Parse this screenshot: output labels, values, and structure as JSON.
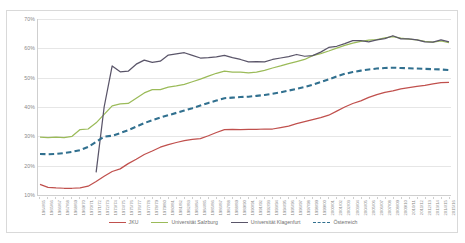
{
  "chart_data": {
    "type": "line",
    "title": "",
    "xlabel": "",
    "ylabel": "",
    "ylim": [
      10,
      70
    ],
    "ytick_labels": [
      "10%",
      "20%",
      "30%",
      "40%",
      "50%",
      "60%",
      "70%"
    ],
    "ytick_values": [
      10,
      20,
      30,
      40,
      50,
      60,
      70
    ],
    "grid": true,
    "legend_position": "bottom",
    "categories": [
      "1964/65",
      "1965/66",
      "1966/67",
      "1967/68",
      "1968/69",
      "1969/70",
      "1970/71",
      "1971/72",
      "1972/73",
      "1973/74",
      "1974/75",
      "1975/76",
      "1976/77",
      "1977/78",
      "1978/79",
      "1979/80",
      "1980/81",
      "1981/82",
      "1982/83",
      "1983/84",
      "1984/85",
      "1985/86",
      "1986/87",
      "1987/88",
      "1988/89",
      "1989/90",
      "1990/91",
      "1991/92",
      "1992/93",
      "1993/94",
      "1994/95",
      "1995/96",
      "1996/97",
      "1997/98",
      "1998/99",
      "1999/00",
      "2000/01",
      "2001/02",
      "2002/03",
      "2003/04",
      "2004/05",
      "2005/06",
      "2006/07",
      "2007/08",
      "2008/09",
      "2009/10",
      "2010/11",
      "2011/12",
      "2012/13",
      "2013/14",
      "2014/15",
      "2015/16"
    ],
    "series": [
      {
        "name": "JKU",
        "color": "#C0504D",
        "style": "solid",
        "values": [
          13.6,
          12.6,
          12.4,
          12.3,
          12.3,
          12.4,
          13.0,
          14.6,
          16.4,
          18.0,
          18.9,
          20.7,
          22.2,
          23.8,
          25.0,
          26.3,
          27.2,
          27.9,
          28.5,
          29.0,
          29.2,
          30.2,
          31.3,
          32.3,
          32.4,
          32.3,
          32.4,
          32.4,
          32.5,
          32.5,
          33.0,
          33.5,
          34.3,
          35.0,
          35.7,
          36.4,
          37.2,
          38.6,
          40.0,
          41.2,
          42.1,
          43.3,
          44.2,
          45.0,
          45.5,
          46.2,
          46.6,
          47.0,
          47.4,
          47.9,
          48.3,
          48.4
        ]
      },
      {
        "name": "Universität Salzburg",
        "color": "#9BBB59",
        "style": "solid",
        "values": [
          29.7,
          29.6,
          29.7,
          29.6,
          30.0,
          32.3,
          32.5,
          34.6,
          37.5,
          40.4,
          41.1,
          41.2,
          43.0,
          44.8,
          45.9,
          45.9,
          46.8,
          47.2,
          47.7,
          48.6,
          49.5,
          50.5,
          51.5,
          52.2,
          51.9,
          51.9,
          51.6,
          51.9,
          52.5,
          53.3,
          54.0,
          54.8,
          55.5,
          56.2,
          57.5,
          58.2,
          59.1,
          60.1,
          61.0,
          61.8,
          62.4,
          62.8,
          63.0,
          63.6,
          64.0,
          63.5,
          63.1,
          62.9,
          62.4,
          62.1,
          62.5,
          61.9
        ]
      },
      {
        "name": "Universität Klagenfurt",
        "color": "#5A5569",
        "style": "solid",
        "values": [
          null,
          null,
          null,
          null,
          null,
          null,
          null,
          17.7,
          40.0,
          54.0,
          52.0,
          52.2,
          54.6,
          56.0,
          55.2,
          55.6,
          57.7,
          58.1,
          58.5,
          57.6,
          56.7,
          56.8,
          57.1,
          57.6,
          56.8,
          56.2,
          55.4,
          55.5,
          55.4,
          56.2,
          56.7,
          57.2,
          57.9,
          57.3,
          57.5,
          58.7,
          60.3,
          60.7,
          61.6,
          62.6,
          62.6,
          62.2,
          62.9,
          63.3,
          64.3,
          63.2,
          63.2,
          62.9,
          62.2,
          62.1,
          62.9,
          62.2
        ]
      },
      {
        "name": "Österreich",
        "color": "#31708F",
        "style": "dashed",
        "values": [
          24.0,
          23.9,
          24.0,
          24.3,
          24.7,
          25.3,
          26.4,
          28.1,
          29.9,
          30.2,
          31.1,
          32.1,
          33.3,
          34.5,
          35.5,
          36.4,
          37.2,
          38.0,
          38.8,
          39.6,
          40.5,
          41.4,
          42.2,
          43.0,
          43.2,
          43.4,
          43.5,
          43.8,
          44.1,
          44.5,
          45.0,
          45.6,
          46.2,
          46.8,
          47.6,
          48.5,
          49.4,
          50.4,
          51.3,
          51.9,
          52.4,
          52.8,
          53.1,
          53.3,
          53.4,
          53.3,
          53.2,
          53.1,
          53.0,
          52.9,
          52.8,
          52.6
        ]
      }
    ],
    "legend": [
      {
        "label": "JKU",
        "color": "#C0504D",
        "style": "solid"
      },
      {
        "label": "Universität Salzburg",
        "color": "#9BBB59",
        "style": "solid"
      },
      {
        "label": "Universität Klagenfurt",
        "color": "#5A5569",
        "style": "solid"
      },
      {
        "label": "Österreich",
        "color": "#31708F",
        "style": "dashed"
      }
    ]
  }
}
